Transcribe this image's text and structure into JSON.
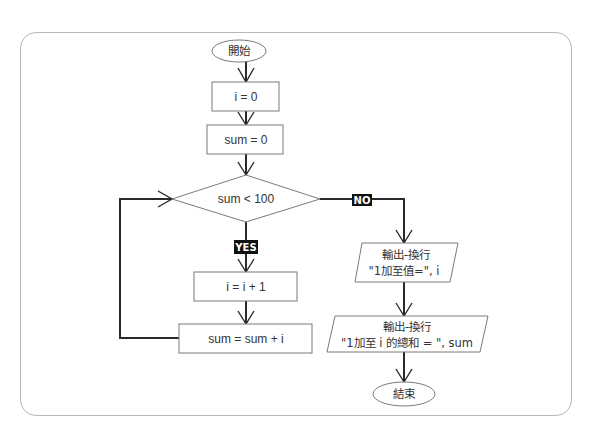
{
  "diagram": {
    "type": "flowchart",
    "nodes": {
      "start": {
        "shape": "terminator",
        "label": "開始"
      },
      "init_i": {
        "shape": "process",
        "label": "i = 0"
      },
      "init_sum": {
        "shape": "process",
        "label": "sum = 0"
      },
      "condition": {
        "shape": "decision",
        "label": "sum < 100"
      },
      "increment_i": {
        "shape": "process",
        "label": "i = i + 1"
      },
      "accumulate": {
        "shape": "process",
        "label": "sum = sum + i"
      },
      "output_i": {
        "shape": "io",
        "line1": "輸出-換行",
        "line2": "\"1加至值=\", i"
      },
      "output_sum": {
        "shape": "io",
        "line1": "輸出-換行",
        "line2": "\"1加至 i 的總和 = \", sum"
      },
      "end": {
        "shape": "terminator",
        "label": "結束"
      }
    },
    "branch_labels": {
      "yes": "YES",
      "no": "NO"
    },
    "edges": [
      {
        "from": "start",
        "to": "init_i"
      },
      {
        "from": "init_i",
        "to": "init_sum"
      },
      {
        "from": "init_sum",
        "to": "condition"
      },
      {
        "from": "condition",
        "to": "increment_i",
        "label": "YES"
      },
      {
        "from": "increment_i",
        "to": "accumulate"
      },
      {
        "from": "accumulate",
        "to": "condition",
        "type": "loop-back"
      },
      {
        "from": "condition",
        "to": "output_i",
        "label": "NO"
      },
      {
        "from": "output_i",
        "to": "output_sum"
      },
      {
        "from": "output_sum",
        "to": "end"
      }
    ]
  }
}
